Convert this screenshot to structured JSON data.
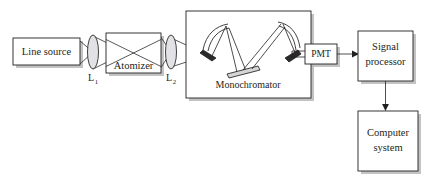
{
  "figure": {
    "background_color": "#ffffff",
    "line_color": "#231f20",
    "shadow_color": "#b9b9b9",
    "lens_fill": "#e2e2e6",
    "grating_fill": "#d5d5d8"
  },
  "components": {
    "line_source": {
      "label": "Line source",
      "kind": "box"
    },
    "lens1": {
      "label": "L",
      "subscript": "1",
      "kind": "lens"
    },
    "atomizer": {
      "label": "Atomizer",
      "kind": "box"
    },
    "lens2": {
      "label": "L",
      "subscript": "2",
      "kind": "lens"
    },
    "monochromator": {
      "label": "Monochromator",
      "kind": "box",
      "internals": [
        "concave-mirror-left",
        "concave-mirror-right",
        "diffraction-grating",
        "fold-mirror-entrance",
        "fold-mirror-exit"
      ]
    },
    "pmt": {
      "label": "PMT",
      "kind": "box"
    },
    "signal_processor": {
      "label_line1": "Signal",
      "label_line2": "processor",
      "kind": "box"
    },
    "computer_system": {
      "label_line1": "Computer",
      "label_line2": "system",
      "kind": "box"
    }
  },
  "connections": [
    {
      "from": "line_source",
      "to": "lens1",
      "type": "light-beam"
    },
    {
      "from": "lens1",
      "to": "atomizer",
      "type": "light-beam"
    },
    {
      "from": "atomizer",
      "to": "lens2",
      "type": "light-beam"
    },
    {
      "from": "lens2",
      "to": "monochromator",
      "type": "light-beam"
    },
    {
      "from": "monochromator",
      "to": "pmt",
      "type": "light-beam"
    },
    {
      "from": "pmt",
      "to": "signal_processor",
      "type": "signal-arrow"
    },
    {
      "from": "signal_processor",
      "to": "computer_system",
      "type": "signal-arrow"
    }
  ]
}
